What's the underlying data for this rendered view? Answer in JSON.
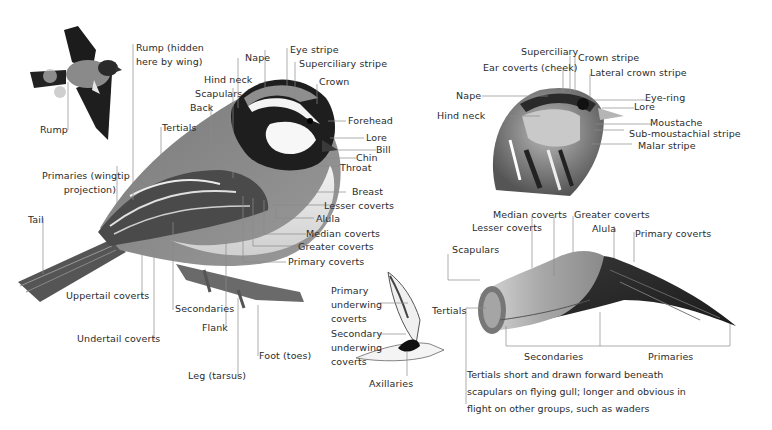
{
  "figure": {
    "panels": {
      "flying_tit": {
        "labels": {
          "rump": "Rump"
        }
      },
      "perched_tit": {
        "labels": {
          "rump_hidden_1": "Rump (hidden",
          "rump_hidden_2": "here by wing)",
          "nape": "Nape",
          "eye_stripe": "Eye stripe",
          "superciliary_stripe": "Superciliary stripe",
          "crown": "Crown",
          "hind_neck": "Hind neck",
          "scapulars": "Scapulars",
          "back": "Back",
          "tertials": "Tertials",
          "forehead": "Forehead",
          "lore": "Lore",
          "bill": "Bill",
          "chin": "Chin",
          "throat": "Throat",
          "primaries_1": "Primaries (wingtip",
          "primaries_2": "projection)",
          "breast": "Breast",
          "lesser_coverts": "Lesser coverts",
          "alula": "Alula",
          "median_coverts": "Median coverts",
          "greater_coverts": "Greater coverts",
          "primary_coverts": "Primary coverts",
          "tail": "Tail",
          "uppertail_coverts": "Uppertail coverts",
          "secondaries": "Secondaries",
          "flank": "Flank",
          "undertail_coverts": "Undertail coverts",
          "foot": "Foot (toes)",
          "leg": "Leg (tarsus)"
        }
      },
      "bunting_head": {
        "labels": {
          "superciliary": "Superciliary",
          "crown_stripe": "Crown stripe",
          "ear_coverts": "Ear coverts (cheek)",
          "lateral_crown_stripe": "Lateral crown stripe",
          "nape": "Nape",
          "eye_ring": "Eye-ring",
          "lore": "Lore",
          "hind_neck": "Hind neck",
          "moustache": "Moustache",
          "sub_moustachial": "Sub-moustachial stripe",
          "malar": "Malar stripe"
        }
      },
      "wader_underwing": {
        "labels": {
          "primary_underwing_1": "Primary",
          "primary_underwing_2": "underwing",
          "primary_underwing_3": "coverts",
          "secondary_underwing_1": "Secondary",
          "secondary_underwing_2": "underwing",
          "secondary_underwing_3": "coverts",
          "axillaries": "Axillaries"
        }
      },
      "gull_wing": {
        "labels": {
          "median_coverts": "Median coverts",
          "greater_coverts": "Greater coverts",
          "lesser_coverts": "Lesser coverts",
          "alula": "Alula",
          "primary_coverts": "Primary coverts",
          "scapulars": "Scapulars",
          "tertials": "Tertials",
          "secondaries": "Secondaries",
          "primaries": "Primaries"
        },
        "note": [
          "Tertials short and drawn forward beneath",
          "scapulars on flying gull; longer and obvious in",
          "flight on other groups, such as waders"
        ]
      }
    },
    "colors": {
      "leader_line": "#8a8a8a",
      "text": "#2b2b2b",
      "tit_crown": "#8d8d8d",
      "tit_dark": "#1e1e1e",
      "tit_wing": "#5a5a5a",
      "tit_belly": "#e6e6e6",
      "gull_primaries": "#2a2a2a"
    }
  }
}
